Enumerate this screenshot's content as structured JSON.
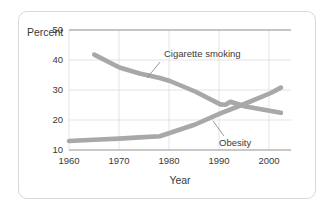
{
  "chart_data": {
    "type": "line",
    "title": "",
    "xlabel": "Year",
    "ylabel": "Percent",
    "xlim": [
      1960,
      2004
    ],
    "ylim": [
      10,
      50
    ],
    "xticks": [
      1960,
      1970,
      1980,
      1990,
      2000
    ],
    "yticks": [
      10,
      20,
      30,
      40,
      50
    ],
    "xtick_labels": [
      "1960",
      "1970",
      "1980",
      "1990",
      "2000"
    ],
    "ytick_labels": [
      "10",
      "20",
      "30",
      "40",
      "50"
    ],
    "grid": true,
    "legend": "inline-annotations",
    "series": [
      {
        "name": "Cigarette smoking",
        "color": "#a8a8a8",
        "x": [
          1965,
          1970,
          1974,
          1978,
          1980,
          1985,
          1990,
          1991,
          1992,
          1995,
          2000,
          2002
        ],
        "values": [
          41.8,
          37.5,
          35.5,
          34.0,
          33.0,
          29.5,
          25.2,
          25.1,
          26.1,
          24.5,
          23.0,
          22.4
        ]
      },
      {
        "name": "Obesity",
        "color": "#a8a8a8",
        "x": [
          1960,
          1965,
          1970,
          1974,
          1978,
          1985,
          1990,
          1995,
          2000,
          2002
        ],
        "values": [
          13.0,
          13.4,
          13.8,
          14.2,
          14.6,
          18.5,
          22.2,
          25.5,
          29.0,
          30.8
        ]
      }
    ],
    "annotations": [
      {
        "text": "Cigarette smoking",
        "x": 1978,
        "y": 45.8
      },
      {
        "text": "Obesity",
        "x": 1992,
        "y": 15.2
      }
    ]
  }
}
